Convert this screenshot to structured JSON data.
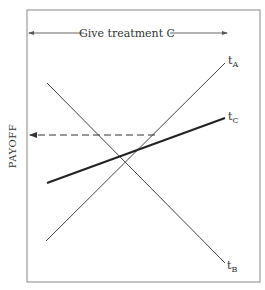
{
  "diagram": {
    "type": "payoff-lines",
    "frame": {
      "x1": 27,
      "y1": 10,
      "x2": 260,
      "y2": 282
    },
    "range_label": "Give treatment C",
    "y_axis_label": "PAYOFF",
    "lines": [
      {
        "id": "tA",
        "label_main": "t",
        "label_sub": "A",
        "x1": 46,
        "y1": 241,
        "x2": 225,
        "y2": 63,
        "stroke_width": 1,
        "color": "#444444"
      },
      {
        "id": "tB",
        "label_main": "t",
        "label_sub": "B",
        "x1": 47,
        "y1": 83,
        "x2": 225,
        "y2": 263,
        "stroke_width": 1,
        "color": "#444444"
      },
      {
        "id": "tC",
        "label_main": "t",
        "label_sub": "C",
        "x1": 47,
        "y1": 183,
        "x2": 225,
        "y2": 118,
        "stroke_width": 2,
        "color": "#222222"
      }
    ],
    "dashed_arrow": {
      "from_x": 155,
      "y": 135,
      "to_x": 29
    },
    "range_arrow": {
      "from_x": 28,
      "to_x": 227,
      "y": 33
    }
  }
}
